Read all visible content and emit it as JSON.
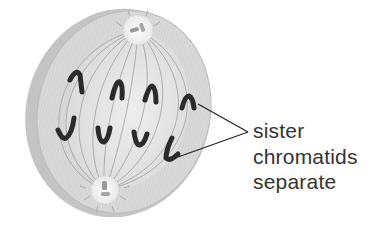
{
  "diagram": {
    "colors": {
      "cell_fill": "#d6d6d6",
      "cell_rim": "#bdbdbd",
      "spindle": "#a8a8a8",
      "chromatid": "#2a2a2a",
      "pole": "#f2f2f2",
      "label_text": "#333333",
      "pointer_line": "#222222"
    },
    "label": {
      "lines": [
        "sister",
        "chromatids",
        "separate"
      ]
    },
    "chromatids": {
      "upper": [
        {
          "x": 78,
          "y": 85
        },
        {
          "x": 118,
          "y": 88
        },
        {
          "x": 150,
          "y": 92
        },
        {
          "x": 188,
          "y": 98
        }
      ],
      "lower": [
        {
          "x": 64,
          "y": 130
        },
        {
          "x": 102,
          "y": 133
        },
        {
          "x": 140,
          "y": 135
        },
        {
          "x": 172,
          "y": 150
        }
      ]
    },
    "poles": {
      "upper": {
        "x": 138,
        "y": 30
      },
      "lower": {
        "x": 105,
        "y": 190
      }
    }
  }
}
